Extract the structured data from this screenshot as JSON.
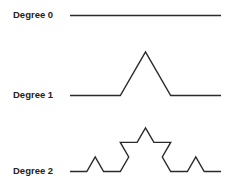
{
  "diagram": {
    "rows": [
      {
        "label": "Degree 0",
        "degree": 0,
        "label_top": 10,
        "baseline_y": 15.5
      },
      {
        "label": "Degree 1",
        "degree": 1,
        "label_top": 90,
        "baseline_y": 95.5
      },
      {
        "label": "Degree 2",
        "degree": 2,
        "label_top": 166,
        "baseline_y": 171.5
      }
    ],
    "x_start": 70,
    "x_end": 221,
    "stroke_color": "#2a2a2a",
    "label_color": "#222222"
  }
}
